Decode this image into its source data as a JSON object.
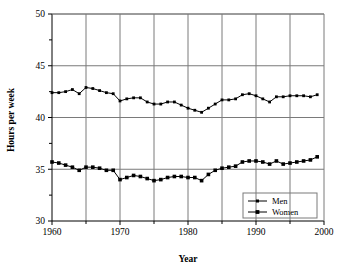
{
  "chart_data": {
    "type": "line",
    "title": "",
    "xlabel": "Year",
    "ylabel": "Hours per week",
    "xlim": [
      1960,
      2000
    ],
    "ylim": [
      30,
      50
    ],
    "grid": true,
    "legend_position": "bottom-right",
    "x_ticks": [
      1960,
      1970,
      1980,
      1990,
      2000
    ],
    "x_tick_labels": [
      "1960",
      "1970",
      "1980",
      "1990",
      "2000"
    ],
    "x_minor_ticks": [
      1965,
      1975,
      1985,
      1995
    ],
    "y_ticks": [
      30,
      35,
      40,
      45,
      50
    ],
    "y_tick_labels": [
      "30",
      "35",
      "40",
      "45",
      "50"
    ],
    "y_minor_ticks": [
      32.5,
      37.5,
      42.5,
      47.5
    ],
    "x": [
      1960,
      1961,
      1962,
      1963,
      1964,
      1965,
      1966,
      1967,
      1968,
      1969,
      1970,
      1971,
      1972,
      1973,
      1974,
      1975,
      1976,
      1977,
      1978,
      1979,
      1980,
      1981,
      1982,
      1983,
      1984,
      1985,
      1986,
      1987,
      1988,
      1989,
      1990,
      1991,
      1992,
      1993,
      1994,
      1995,
      1996,
      1997,
      1998,
      1999
    ],
    "series": [
      {
        "name": "Men",
        "marker": "small-square",
        "values": [
          42.4,
          42.4,
          42.5,
          42.7,
          42.3,
          42.9,
          42.8,
          42.6,
          42.4,
          42.3,
          41.6,
          41.8,
          41.9,
          41.9,
          41.5,
          41.3,
          41.3,
          41.5,
          41.5,
          41.2,
          40.9,
          40.7,
          40.5,
          40.9,
          41.3,
          41.7,
          41.7,
          41.8,
          42.2,
          42.3,
          42.1,
          41.8,
          41.5,
          42.0,
          42.0,
          42.1,
          42.1,
          42.1,
          42.0,
          42.2
        ]
      },
      {
        "name": "Women",
        "marker": "large-square",
        "values": [
          35.7,
          35.6,
          35.4,
          35.2,
          34.9,
          35.2,
          35.2,
          35.1,
          34.9,
          34.9,
          34.0,
          34.2,
          34.4,
          34.3,
          34.1,
          33.9,
          34.0,
          34.2,
          34.3,
          34.3,
          34.2,
          34.2,
          33.9,
          34.5,
          34.9,
          35.1,
          35.2,
          35.3,
          35.7,
          35.8,
          35.8,
          35.7,
          35.5,
          35.8,
          35.5,
          35.6,
          35.7,
          35.8,
          35.9,
          36.2
        ]
      }
    ]
  },
  "legend": {
    "entries": [
      {
        "label": "Men"
      },
      {
        "label": "Women"
      }
    ]
  }
}
